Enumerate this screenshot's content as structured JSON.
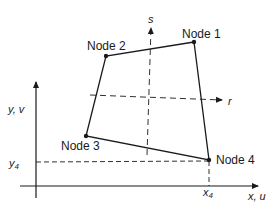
{
  "diagram": {
    "type": "quadrilateral-element-mapping",
    "colors": {
      "ink": "#1a1a1a",
      "background": "#ffffff"
    },
    "nodes": [
      {
        "id": 1,
        "label": "Node 1",
        "x": 194,
        "y": 42
      },
      {
        "id": 2,
        "label": "Node 2",
        "x": 106,
        "y": 56
      },
      {
        "id": 3,
        "label": "Node 3",
        "x": 86,
        "y": 136
      },
      {
        "id": 4,
        "label": "Node 4",
        "x": 209,
        "y": 160
      }
    ],
    "global_axes": {
      "vertical_label": "y, v",
      "horizontal_label": "x, u"
    },
    "local_axes": {
      "s_label": "s",
      "r_label": "r"
    },
    "projections": {
      "y_label": "y",
      "y_sub": "4",
      "x_label": "x",
      "x_sub": "4"
    }
  }
}
